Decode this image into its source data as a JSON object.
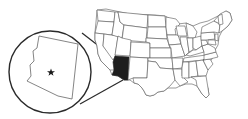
{
  "map": {
    "type": "locator-map",
    "region": "United States",
    "highlighted_state": "Arizona",
    "inset": {
      "subject": "Arizona",
      "marker": "star-icon",
      "marker_meaning": "capital"
    },
    "colors": {
      "highlight": "#1e1e1e",
      "state_fill": "#ffffff",
      "state_border": "#555555",
      "inset_border": "#2a2a2a",
      "background": "#ffffff"
    }
  }
}
